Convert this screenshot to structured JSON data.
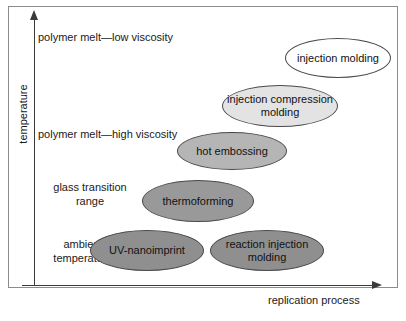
{
  "figure": {
    "background": "#ffffff",
    "frame_color": "#8c8c8c",
    "axis_color": "#3a3a3a"
  },
  "axes": {
    "y_title": "temperature",
    "x_title": "replication process"
  },
  "chart_data": {
    "type": "scatter",
    "title": "",
    "xlabel": "replication process",
    "ylabel": "temperature",
    "grid": false,
    "legend": "none",
    "y_category_labels": [
      "polymer melt—low viscosity",
      "polymer melt—high viscosity",
      "glass transition\nrange",
      "ambient\ntemperature"
    ],
    "nodes": [
      {
        "label": "injection molding",
        "fill": "#ffffff",
        "x_rank": 6,
        "y_band": "polymer melt—low viscosity",
        "left": 285,
        "top": 38,
        "width": 106,
        "height": 40
      },
      {
        "label": "injection compression\nmolding",
        "fill": "#e3e3e3",
        "x_rank": 5,
        "y_band": "between low and high viscosity melt",
        "left": 222,
        "top": 85,
        "width": 116,
        "height": 42
      },
      {
        "label": "hot embossing",
        "fill": "#b5b5b5",
        "x_rank": 4,
        "y_band": "polymer melt—high viscosity",
        "left": 177,
        "top": 132,
        "width": 110,
        "height": 38
      },
      {
        "label": "thermoforming",
        "fill": "#999999",
        "x_rank": 3,
        "y_band": "glass transition range",
        "left": 142,
        "top": 180,
        "width": 112,
        "height": 42
      },
      {
        "label": "UV-nanoimprint",
        "fill": "#8f8f8f",
        "x_rank": 1,
        "y_band": "ambient temperature",
        "left": 90,
        "top": 230,
        "width": 114,
        "height": 41
      },
      {
        "label": "reaction injection\nmolding",
        "fill": "#8f8f8f",
        "x_rank": 2,
        "y_band": "ambient temperature",
        "left": 210,
        "top": 230,
        "width": 114,
        "height": 41
      }
    ],
    "y_bands": [
      {
        "label": "polymer melt—low viscosity",
        "left": 38,
        "top": 30,
        "width": 160,
        "align": "left"
      },
      {
        "label": "polymer melt—high viscosity",
        "left": 38,
        "top": 127,
        "width": 165,
        "align": "left"
      },
      {
        "label": "glass transition\nrange",
        "left": 38,
        "top": 180,
        "width": 104,
        "align": "center"
      },
      {
        "label": "ambient\ntemperature",
        "left": 31,
        "top": 237,
        "width": 104,
        "align": "center"
      }
    ]
  }
}
